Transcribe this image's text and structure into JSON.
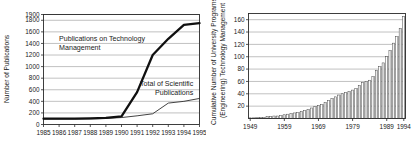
{
  "figure": {
    "panels": [
      {
        "id": "publications-line-chart",
        "ylabel": "Number of Publications",
        "xlabel": "",
        "annotations": [
          "Publications on Technology",
          "Management",
          "Total of Scientific",
          "Publications"
        ]
      },
      {
        "id": "university-programs-bar-chart",
        "ylabel_line1": "Cumulative Number of University Programs on",
        "ylabel_line2": "(Engineering) Technology Management",
        "xlabel": ""
      }
    ]
  },
  "chart_data": [
    {
      "type": "line",
      "title": "",
      "xlabel": "",
      "ylabel": "Number of Publications",
      "x": [
        1985,
        1986,
        1987,
        1988,
        1989,
        1990,
        1991,
        1992,
        1993,
        1994,
        1995
      ],
      "xtick_labels": [
        "1985",
        "1986",
        "1987",
        "1988",
        "1989",
        "1990",
        "1991",
        "1992",
        "1993",
        "1994",
        "1995"
      ],
      "ytick_labels": [
        "0",
        "200",
        "400",
        "600",
        "800",
        "1000",
        "1200",
        "1400",
        "1600",
        "1800",
        "1900"
      ],
      "yticks": [
        0,
        200,
        400,
        600,
        800,
        1000,
        1200,
        1400,
        1600,
        1800,
        1900
      ],
      "xlim": [
        1985,
        1995
      ],
      "ylim": [
        0,
        1900
      ],
      "grid": true,
      "legend_position": "inline-annotation",
      "series": [
        {
          "name": "Publications on Technology Management",
          "style": "bold",
          "values": [
            100,
            100,
            100,
            105,
            115,
            140,
            560,
            1200,
            1480,
            1720,
            1750
          ]
        },
        {
          "name": "Total of Scientific Publications",
          "style": "thin",
          "values": [
            95,
            95,
            95,
            98,
            105,
            120,
            150,
            185,
            370,
            400,
            450
          ]
        }
      ],
      "annotations": [
        {
          "text": "Publications on Technology",
          "x": 1986.0,
          "y": 1450
        },
        {
          "text": "Management",
          "x": 1986.0,
          "y": 1290
        },
        {
          "text": "Total of Scientific",
          "x": 1994.6,
          "y": 660
        },
        {
          "text": "Publications",
          "x": 1994.6,
          "y": 505
        }
      ]
    },
    {
      "type": "bar",
      "title": "",
      "xlabel": "",
      "ylabel": "Cumulative Number of University Programs on (Engineering) Technology Management",
      "xtick_labels": [
        "1949",
        "1959",
        "1969",
        "1979",
        "1989",
        "1994"
      ],
      "xticks": [
        1949,
        1959,
        1969,
        1979,
        1989,
        1994
      ],
      "ytick_labels": [
        "20",
        "40",
        "60",
        "80",
        "100",
        "120",
        "140",
        "160"
      ],
      "yticks": [
        20,
        40,
        60,
        80,
        100,
        120,
        140,
        160
      ],
      "xlim": [
        1949,
        1995
      ],
      "ylim": [
        0,
        170
      ],
      "grid": true,
      "categories": [
        1949,
        1950,
        1951,
        1952,
        1953,
        1954,
        1955,
        1956,
        1957,
        1958,
        1959,
        1960,
        1961,
        1962,
        1963,
        1964,
        1965,
        1966,
        1967,
        1968,
        1969,
        1970,
        1971,
        1972,
        1973,
        1974,
        1975,
        1976,
        1977,
        1978,
        1979,
        1980,
        1981,
        1982,
        1983,
        1984,
        1985,
        1986,
        1987,
        1988,
        1989,
        1990,
        1991,
        1992,
        1993,
        1994
      ],
      "values": [
        1,
        1,
        2,
        2,
        2,
        3,
        3,
        4,
        4,
        5,
        6,
        7,
        8,
        9,
        10,
        11,
        13,
        15,
        17,
        19,
        21,
        23,
        26,
        29,
        32,
        35,
        38,
        40,
        42,
        44,
        46,
        49,
        53,
        58,
        60,
        62,
        68,
        78,
        84,
        90,
        100,
        110,
        122,
        133,
        146,
        165
      ]
    }
  ],
  "colors": {
    "series_bold": "#101010",
    "series_thin": "#2e2e2e",
    "bar_fill": "#ffffff",
    "bar_edge": "#333333",
    "bar_shade": "#9a9a9a",
    "gridline": "#8e8e8e",
    "frame": "#2b2b2b",
    "background": "#ffffff"
  }
}
